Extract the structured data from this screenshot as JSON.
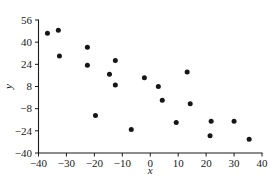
{
  "chart_data": {
    "type": "scatter",
    "title": "",
    "xlabel": "x",
    "ylabel": "y",
    "xlim": [
      -40,
      40
    ],
    "ylim": [
      -40,
      56
    ],
    "xticks": [
      -40,
      -30,
      -20,
      -10,
      0,
      10,
      20,
      30,
      40
    ],
    "xtick_labels": [
      "-40",
      "-30",
      "-20",
      "-10",
      "0",
      "10",
      "20",
      "30",
      "40"
    ],
    "yticks": [
      -40,
      -24,
      -8,
      8,
      24,
      40,
      56
    ],
    "ytick_labels": [
      "-40",
      "-24",
      "-8",
      "8",
      "24",
      "40",
      "56"
    ],
    "grid": false,
    "legend": false,
    "marker": "filled-circle",
    "marker_color": "#161616",
    "marker_size": 4,
    "points": [
      {
        "x": -36.8,
        "y": 46.4
      },
      {
        "x": -32.9,
        "y": 48.6
      },
      {
        "x": -32.5,
        "y": 30.0
      },
      {
        "x": -22.5,
        "y": 36.4
      },
      {
        "x": -22.5,
        "y": 23.4
      },
      {
        "x": -19.6,
        "y": -13.0
      },
      {
        "x": -14.6,
        "y": 16.9
      },
      {
        "x": -12.5,
        "y": 26.7
      },
      {
        "x": -12.5,
        "y": 9.0
      },
      {
        "x": -6.8,
        "y": -23.0
      },
      {
        "x": -2.1,
        "y": 14.3
      },
      {
        "x": 2.9,
        "y": 8.0
      },
      {
        "x": 4.3,
        "y": -2.0
      },
      {
        "x": 9.3,
        "y": -18.0
      },
      {
        "x": 13.2,
        "y": 18.5
      },
      {
        "x": 14.3,
        "y": -4.5
      },
      {
        "x": 21.4,
        "y": -27.5
      },
      {
        "x": 21.8,
        "y": -17.0
      },
      {
        "x": 30.0,
        "y": -17.0
      },
      {
        "x": 35.4,
        "y": -30.0
      }
    ]
  },
  "axis_titles": {
    "x": "x",
    "y": "y"
  }
}
